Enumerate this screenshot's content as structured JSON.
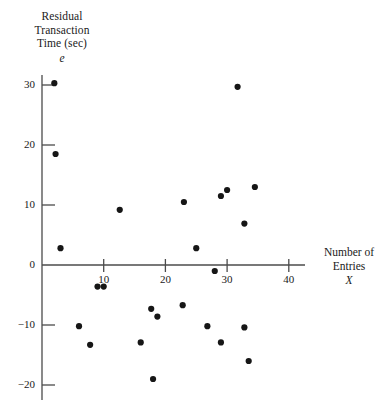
{
  "chart_data": {
    "type": "scatter",
    "title": "",
    "ylabel_lines": [
      "Residual",
      "Transaction",
      "Time (sec)"
    ],
    "ylabel_symbol": "e",
    "xlabel_lines": [
      "Number of",
      "Entries"
    ],
    "xlabel_symbol": "X",
    "xlabel": "Number of Entries",
    "ylabel": "Residual Transaction Time (sec)",
    "xlim": [
      0,
      44
    ],
    "ylim": [
      -22,
      33
    ],
    "xticks": [
      10,
      20,
      30,
      40
    ],
    "yticks": [
      30,
      20,
      10,
      0,
      -10,
      -20
    ],
    "xtick_labels": [
      "10",
      "20",
      "30",
      "40"
    ],
    "ytick_labels": [
      "30",
      "20",
      "10",
      "0",
      "−10",
      "−20"
    ],
    "grid": false,
    "legend": null,
    "marker_color": "#161616",
    "axis_color": "#4b4b4b",
    "points": [
      {
        "x": 2.0,
        "y": 30.3
      },
      {
        "x": 2.2,
        "y": 18.5
      },
      {
        "x": 3.0,
        "y": 2.8
      },
      {
        "x": 6.0,
        "y": -10.2
      },
      {
        "x": 7.8,
        "y": -13.3
      },
      {
        "x": 9.0,
        "y": -3.6
      },
      {
        "x": 10.0,
        "y": -3.6
      },
      {
        "x": 12.6,
        "y": 9.2
      },
      {
        "x": 16.0,
        "y": -12.9
      },
      {
        "x": 17.7,
        "y": -7.3
      },
      {
        "x": 18.0,
        "y": -19.0
      },
      {
        "x": 18.7,
        "y": -8.6
      },
      {
        "x": 22.8,
        "y": -6.7
      },
      {
        "x": 23.0,
        "y": 10.5
      },
      {
        "x": 25.0,
        "y": 2.8
      },
      {
        "x": 26.8,
        "y": -10.2
      },
      {
        "x": 28.0,
        "y": -1.0
      },
      {
        "x": 29.0,
        "y": 11.5
      },
      {
        "x": 29.0,
        "y": -12.9
      },
      {
        "x": 30.0,
        "y": 12.5
      },
      {
        "x": 31.7,
        "y": 29.7
      },
      {
        "x": 32.8,
        "y": 6.9
      },
      {
        "x": 32.8,
        "y": -10.4
      },
      {
        "x": 33.5,
        "y": -16.0
      },
      {
        "x": 34.5,
        "y": 13.0
      }
    ]
  }
}
